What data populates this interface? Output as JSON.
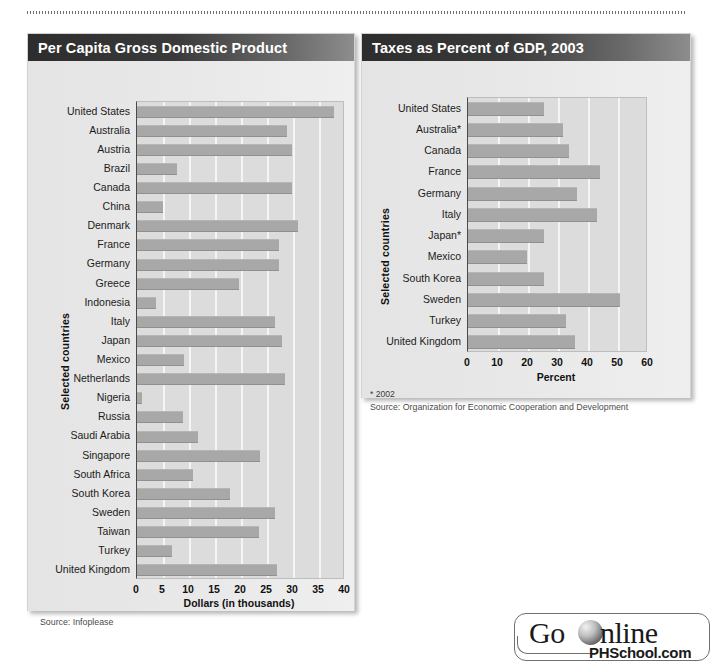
{
  "page": {
    "background_color": "#ffffff",
    "rule_style": "dotted"
  },
  "badge": {
    "go_label": "Go",
    "online_label": "nline",
    "site_label": "PHSchool.com",
    "globe_icon": "globe-icon"
  },
  "charts": [
    {
      "id": "gdp-per-capita",
      "title": "Per Capita Gross Domestic Product",
      "source": "Source:  Infoplease",
      "footnote": "",
      "chart_data": {
        "type": "bar",
        "orientation": "horizontal",
        "title": "Per Capita Gross Domestic Product",
        "xlabel": "Dollars (in thousands)",
        "ylabel": "Selected countries",
        "xlim": [
          0,
          40
        ],
        "xticks": [
          0,
          5,
          10,
          15,
          20,
          25,
          30,
          35,
          40
        ],
        "xtick_labels": [
          "0",
          "5",
          "10",
          "15",
          "20",
          "25",
          "30",
          "35",
          "40"
        ],
        "grid": true,
        "legend": "none",
        "bar_color": "#a8a8a8",
        "categories": [
          "United States",
          "Australia",
          "Austria",
          "Brazil",
          "Canada",
          "China",
          "Denmark",
          "France",
          "Germany",
          "Greece",
          "Indonesia",
          "Italy",
          "Japan",
          "Mexico",
          "Netherlands",
          "Nigeria",
          "Russia",
          "Saudi Arabia",
          "Singapore",
          "South Africa",
          "South Korea",
          "Sweden",
          "Taiwan",
          "Turkey",
          "United Kingdom"
        ],
        "values": [
          37.8,
          28.9,
          29.9,
          7.6,
          29.8,
          5.0,
          30.9,
          27.4,
          27.3,
          19.7,
          3.7,
          26.5,
          27.8,
          9.0,
          28.4,
          0.9,
          8.9,
          11.8,
          23.7,
          10.7,
          17.8,
          26.6,
          23.4,
          6.7,
          27.0
        ]
      }
    },
    {
      "id": "taxes-percent-gdp",
      "title": "Taxes as Percent of GDP, 2003",
      "footnote": "* 2002",
      "source": "Source:  Organization for Economic Cooperation and Development",
      "chart_data": {
        "type": "bar",
        "orientation": "horizontal",
        "title": "Taxes as Percent of GDP, 2003",
        "xlabel": "Percent",
        "ylabel": "Selected countries",
        "xlim": [
          0,
          60
        ],
        "xticks": [
          0,
          10,
          20,
          30,
          40,
          50,
          60
        ],
        "xtick_labels": [
          "0",
          "10",
          "20",
          "30",
          "40",
          "50",
          "60"
        ],
        "grid": true,
        "legend": "none",
        "bar_color": "#a8a8a8",
        "categories": [
          "United States",
          "Australia*",
          "Canada",
          "France",
          "Germany",
          "Italy",
          "Japan*",
          "Mexico",
          "South Korea",
          "Sweden",
          "Turkey",
          "United Kingdom"
        ],
        "values": [
          25.4,
          31.6,
          33.8,
          44.0,
          36.2,
          43.1,
          25.3,
          19.5,
          25.3,
          50.6,
          32.8,
          35.6
        ]
      }
    }
  ]
}
